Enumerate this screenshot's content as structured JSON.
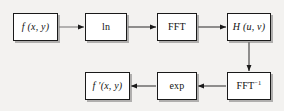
{
  "diagram": {
    "background_color": "#f3f2f0",
    "box_fill_color": "#ffffff",
    "box_border_color": "#1a1a1a",
    "arrow_color": "#1a1a1a",
    "nodes": [
      {
        "id": "f",
        "label": "f (x, y)",
        "style": "math",
        "row": "top",
        "order": 1
      },
      {
        "id": "ln",
        "label": "ln",
        "style": "roman",
        "row": "top",
        "order": 2
      },
      {
        "id": "fft",
        "label": "FFT",
        "style": "roman",
        "row": "top",
        "order": 3
      },
      {
        "id": "h",
        "label": "H (u, v)",
        "style": "math",
        "row": "top",
        "order": 4
      },
      {
        "id": "ffti",
        "label": "FFT",
        "superscript": "−1",
        "style": "roman",
        "row": "bottom",
        "order": 5
      },
      {
        "id": "exp",
        "label": "exp",
        "style": "roman",
        "row": "bottom",
        "order": 6
      },
      {
        "id": "fprime",
        "label": "f ′(x, y)",
        "style": "math",
        "row": "bottom",
        "order": 7
      }
    ],
    "edges": [
      {
        "from": "f",
        "to": "ln",
        "direction": "right"
      },
      {
        "from": "ln",
        "to": "fft",
        "direction": "right"
      },
      {
        "from": "fft",
        "to": "h",
        "direction": "right"
      },
      {
        "from": "h",
        "to": "ffti",
        "direction": "down"
      },
      {
        "from": "ffti",
        "to": "exp",
        "direction": "left"
      },
      {
        "from": "exp",
        "to": "fprime",
        "direction": "left"
      }
    ]
  }
}
